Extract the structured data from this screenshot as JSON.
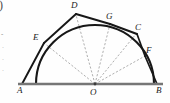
{
  "figure": {
    "type": "geometry-diagram",
    "colors": {
      "stroke_dark": "#171717",
      "baseline_gray": "#767676",
      "radius_dashed": "#8d8d8d",
      "label_text": "#1a1a1a",
      "background": "#fefefe"
    },
    "baseline": {
      "name": "diameter-line",
      "from": "A",
      "to": "B",
      "x1": 18,
      "y1": 84,
      "x2": 163,
      "y2": 84
    },
    "circle": {
      "center_label": "O",
      "center_x": 95,
      "center_y": 84,
      "radius": 59
    },
    "points": [
      {
        "id": "A",
        "label": "A",
        "x": 22,
        "y": 84,
        "label_x": 18,
        "label_y": 86,
        "on_arc": false
      },
      {
        "id": "E",
        "label": "E",
        "x": 44,
        "y": 43,
        "label_x": 34,
        "label_y": 36,
        "on_arc": true
      },
      {
        "id": "D",
        "label": "D",
        "x": 76,
        "y": 14,
        "label_x": 72,
        "label_y": 2,
        "on_arc": false
      },
      {
        "id": "G",
        "label": "G",
        "x": 110,
        "y": 24,
        "label_x": 107,
        "label_y": 13,
        "on_arc": true
      },
      {
        "id": "C",
        "label": "C",
        "x": 136,
        "y": 33,
        "label_x": 136,
        "label_y": 25,
        "on_arc": false
      },
      {
        "id": "F",
        "label": "F",
        "x": 145,
        "y": 56,
        "label_x": 146,
        "label_y": 48,
        "on_arc": true
      },
      {
        "id": "B",
        "label": "B",
        "x": 157,
        "y": 84,
        "label_x": 157,
        "label_y": 86,
        "on_arc": false
      },
      {
        "id": "O",
        "label": "O",
        "x": 95,
        "y": 84,
        "label_x": 91,
        "label_y": 88,
        "on_arc": false
      }
    ],
    "arc": {
      "name": "semicircular-arc",
      "start_x": 36,
      "start_y": 84,
      "end_x": 154,
      "end_y": 84,
      "apex_x": 95,
      "apex_y": 25
    },
    "polygon_path": [
      "A",
      "E",
      "D",
      "G",
      "C",
      "F",
      "B"
    ],
    "radii_dashed": [
      {
        "from": "O",
        "to": "E"
      },
      {
        "from": "O",
        "to": "D"
      },
      {
        "from": "O",
        "to": "G"
      },
      {
        "from": "O",
        "to": "C"
      },
      {
        "from": "O",
        "to": "F"
      }
    ],
    "margin_artifacts": [
      {
        "id": "paren",
        "text": ")"
      },
      {
        "id": "dash1",
        "text": "-"
      },
      {
        "id": "dot1",
        "text": "·"
      },
      {
        "id": "dot2",
        "text": "·"
      },
      {
        "id": "dot3",
        "text": "·"
      }
    ]
  }
}
